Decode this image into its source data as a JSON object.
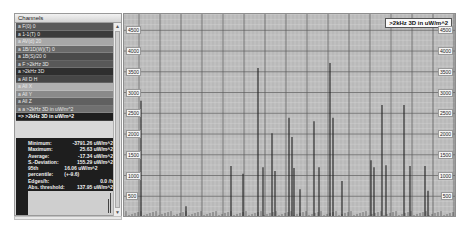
{
  "channels_panel": {
    "title": "Channels",
    "items": [
      {
        "label": "a F(0) 0",
        "color": "#5a5a5a"
      },
      {
        "label": "a 1-1(T) 0",
        "color": "#3c3c3c"
      },
      {
        "label": "a AV(d) 20",
        "color": "#a8a8a8"
      },
      {
        "label": "a 1B/1D(W)(T) 0",
        "color": "#6a6a6a"
      },
      {
        "label": "a 1B(S)/20 0",
        "color": "#4a4a4a"
      },
      {
        "label": "a F >2kHz 3D",
        "color": "#585858"
      },
      {
        "label": "a >2kHz 3D",
        "color": "#2e2e2e"
      },
      {
        "label": "a All D H",
        "color": "#464646"
      },
      {
        "label": "a All X",
        "color": "#b0b0b0"
      },
      {
        "label": "a All Y",
        "color": "#8a8a8a"
      },
      {
        "label": "a All Z",
        "color": "#606060"
      },
      {
        "label": "a a >2kHz 3D in uW/m^2",
        "color": "#707070"
      },
      {
        "label": "=> >2kHz 3D in uW/m^2",
        "color": "#1e1e1e",
        "selected": true
      }
    ],
    "stats": [
      {
        "label": "Minimum:",
        "value": "-3791.26 uW/m^2"
      },
      {
        "label": "Maximum:",
        "value": "25.63 uW/m^2"
      },
      {
        "label": "Average:",
        "value": "-17.34 uW/m^2"
      },
      {
        "label": "S.-Deviation:",
        "value": "155.29 uW/m^2"
      },
      {
        "label": "95th percentile:",
        "value": "16.06 uW/m^2 (+-9.6)"
      },
      {
        "label": "Edges/h:",
        "value": "0.0 /h"
      },
      {
        "label": "Abs. threshold:",
        "value": "137.95 uW/m^2"
      }
    ]
  },
  "chart_data": {
    "type": "bar",
    "title": "",
    "legend": [
      ">2kHz 3D in uW/m^2"
    ],
    "xlabel": "",
    "ylabel": "",
    "ylim": [
      0,
      4800
    ],
    "yticks": [
      500,
      1000,
      1500,
      2000,
      2500,
      3000,
      3500,
      4000,
      4500
    ],
    "grid": true,
    "legend_position": "top-right",
    "series": [
      {
        "name": ">2kHz 3D in uW/m^2",
        "x_px": [
          17,
          62,
          107,
          119,
          134,
          139,
          148,
          151,
          165,
          168,
          170,
          176,
          190,
          195,
          206,
          209,
          218,
          247,
          250,
          258,
          262,
          280,
          286,
          301,
          304
        ],
        "values": [
          2800,
          260,
          1230,
          1040,
          3590,
          1200,
          2020,
          1110,
          2390,
          1930,
          1180,
          670,
          2310,
          1200,
          3710,
          2390,
          870,
          1370,
          1200,
          2700,
          1250,
          2700,
          1230,
          1230,
          630
        ]
      }
    ]
  },
  "chart": {
    "legend_label": ">2kHz 3D in uW/m^2",
    "left_ticks": [
      "4500",
      "4000",
      "3500",
      "3000",
      "2500",
      "2000",
      "1500",
      "1000",
      "500"
    ],
    "right_ticks": [
      "4500",
      "4000",
      "3500",
      "3000",
      "2500",
      "2000",
      "1500",
      "1000",
      "500"
    ]
  },
  "colors": {
    "plot_bg": "#b9b9b9",
    "grid_major": "#5a5a5a",
    "grid_minor": "#d8d8d8",
    "spike": "#202020"
  },
  "scroll": {
    "up": "▲",
    "down": "▼"
  }
}
